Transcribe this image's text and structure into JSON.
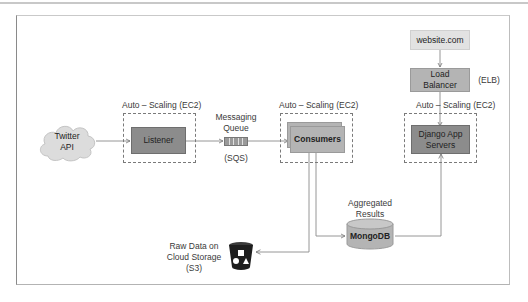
{
  "diagram": {
    "nodes": {
      "twitter_api": {
        "line1": "Twitter",
        "line2": "API"
      },
      "listener": {
        "label": "Listener",
        "group_label": "Auto – Scaling (EC2)"
      },
      "queue": {
        "title_line1": "Messaging",
        "title_line2": "Queue",
        "service": "(SQS)"
      },
      "consumers": {
        "label": "Consumers",
        "group_label": "Auto – Scaling (EC2)"
      },
      "website": {
        "label": "website.com"
      },
      "load_balancer": {
        "line1": "Load",
        "line2": "Balancer",
        "service": "(ELB)"
      },
      "django": {
        "line1": "Django App",
        "line2": "Servers",
        "group_label": "Auto – Scaling (EC2)"
      },
      "mongodb": {
        "label": "MongoDB",
        "title_line1": "Aggregated",
        "title_line2": "Results"
      },
      "s3": {
        "line1": "Raw Data on",
        "line2": "Cloud Storage",
        "line3": "(S3)"
      }
    },
    "edges": [
      {
        "from": "twitter_api",
        "to": "listener"
      },
      {
        "from": "listener",
        "to": "queue"
      },
      {
        "from": "queue",
        "to": "consumers"
      },
      {
        "from": "consumers",
        "to": "mongodb"
      },
      {
        "from": "consumers",
        "to": "s3"
      },
      {
        "from": "mongodb",
        "to": "django"
      },
      {
        "from": "website",
        "to": "load_balancer"
      },
      {
        "from": "load_balancer",
        "to": "django"
      }
    ],
    "colors": {
      "dark_box": "#8c8c8c",
      "mid_box": "#b4b4b4",
      "light_box": "#e2e2e2",
      "line": "#7a7a7a"
    }
  }
}
